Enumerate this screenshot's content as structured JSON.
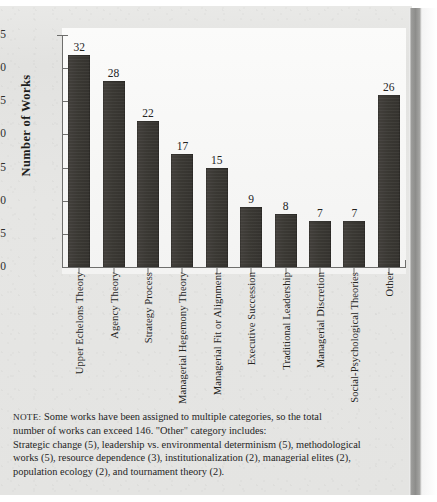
{
  "figure": {
    "ylabel": "Number of Works"
  },
  "chart_data": {
    "type": "bar",
    "title": "",
    "xlabel": "",
    "ylabel": "Number of Works",
    "ylim": [
      0,
      35
    ],
    "yticks": [
      0,
      5,
      10,
      15,
      20,
      25,
      30,
      35
    ],
    "grid": false,
    "legend": false,
    "bar_color": "#3a3833",
    "categories": [
      "Upper Echelons Theory",
      "Agency Theory",
      "Strategy Process",
      "Managerial Hegemony Theory",
      "Managerial Fit or Alignment",
      "Executive Succession",
      "Traditional Leadership",
      "Managerial Discretion",
      "Social-Psychological Theories",
      "Other"
    ],
    "values": [
      32,
      28,
      22,
      17,
      15,
      9,
      8,
      7,
      7,
      26
    ]
  },
  "note": {
    "lead": "NOTE:",
    "lines": [
      "Some works have been assigned to multiple categories, so the total",
      "number of works can exceed 146.  \"Other\" category includes:",
      "Strategic change (5), leadership vs. environmental determinism (5), methodological",
      "works (5), resource dependence (3), institutionalization (2), managerial elites (2),",
      "population ecology (2), and tournament theory (2)."
    ]
  }
}
